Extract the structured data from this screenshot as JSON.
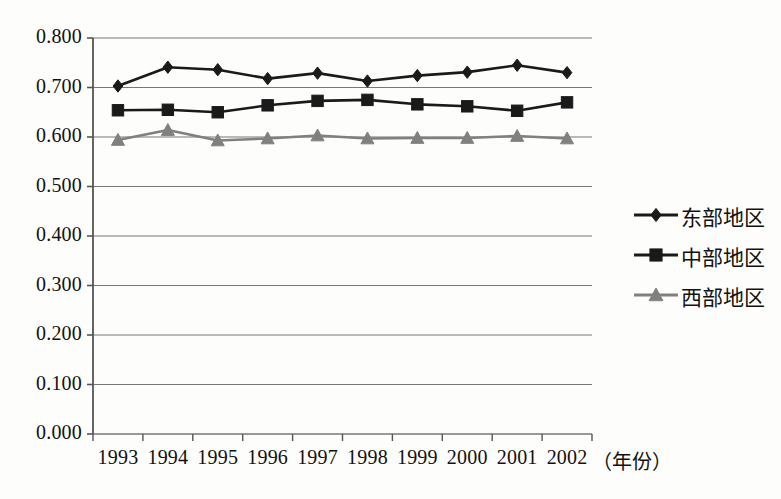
{
  "chart_data": {
    "type": "line",
    "title": "",
    "subtitle": "",
    "xlabel": "（年份）",
    "ylabel": "",
    "categories": [
      "1993",
      "1994",
      "1995",
      "1996",
      "1997",
      "1998",
      "1999",
      "2000",
      "2001",
      "2002"
    ],
    "ylim": [
      0.0,
      0.8
    ],
    "ytick_labels": [
      "0.800",
      "0.700",
      "0.600",
      "0.500",
      "0.400",
      "0.300",
      "0.200",
      "0.100",
      "0.000"
    ],
    "ytick_values": [
      0.8,
      0.7,
      0.6,
      0.5,
      0.4,
      0.3,
      0.2,
      0.1,
      0.0
    ],
    "grid": true,
    "grid_axis": "y",
    "legend_position": "right",
    "series": [
      {
        "name": "东部地区",
        "marker": "diamond",
        "color": "#1a1a1a",
        "values": [
          0.703,
          0.741,
          0.736,
          0.718,
          0.729,
          0.713,
          0.724,
          0.731,
          0.745,
          0.73
        ]
      },
      {
        "name": "中部地区",
        "marker": "square",
        "color": "#1a1a1a",
        "values": [
          0.654,
          0.655,
          0.65,
          0.664,
          0.673,
          0.675,
          0.666,
          0.662,
          0.653,
          0.67
        ]
      },
      {
        "name": "西部地区",
        "marker": "triangle",
        "color": "#808080",
        "values": [
          0.594,
          0.614,
          0.593,
          0.597,
          0.603,
          0.597,
          0.598,
          0.598,
          0.602,
          0.597
        ]
      }
    ]
  },
  "axis": {
    "y_ticks": [
      {
        "label": "0.800"
      },
      {
        "label": "0.700"
      },
      {
        "label": "0.600"
      },
      {
        "label": "0.500"
      },
      {
        "label": "0.400"
      },
      {
        "label": "0.300"
      },
      {
        "label": "0.200"
      },
      {
        "label": "0.100"
      },
      {
        "label": "0.000"
      }
    ],
    "x_ticks": [
      {
        "label": "1993"
      },
      {
        "label": "1994"
      },
      {
        "label": "1995"
      },
      {
        "label": "1996"
      },
      {
        "label": "1997"
      },
      {
        "label": "1998"
      },
      {
        "label": "1999"
      },
      {
        "label": "2000"
      },
      {
        "label": "2001"
      },
      {
        "label": "2002"
      }
    ],
    "x_title": "（年份）"
  },
  "legend": {
    "items": [
      {
        "label": "东部地区",
        "marker": "diamond-marker-icon",
        "color": "#1a1a1a"
      },
      {
        "label": "中部地区",
        "marker": "square-marker-icon",
        "color": "#1a1a1a"
      },
      {
        "label": "西部地区",
        "marker": "triangle-marker-icon",
        "color": "#808080"
      }
    ]
  },
  "colors": {
    "background": "#fdfdfb",
    "axis": "#555555",
    "grid": "#777777",
    "series_dark": "#1a1a1a",
    "series_gray": "#808080",
    "text": "#111111"
  }
}
